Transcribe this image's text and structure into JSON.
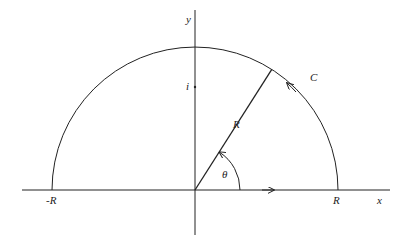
{
  "diagram": {
    "labels": {
      "y_axis": "y",
      "x_axis": "x",
      "i_mark": "i",
      "neg_r": "-R",
      "pos_r": "R",
      "radius": "R",
      "contour": "C",
      "angle": "θ"
    },
    "geometry": {
      "origin": [
        195,
        190
      ],
      "radius_px": 143,
      "theta_deg": 57.5,
      "angle_arc_radius_px": 45,
      "i_mark_y": 87
    },
    "colors": {
      "stroke": "#222222",
      "background": "#ffffff"
    }
  }
}
